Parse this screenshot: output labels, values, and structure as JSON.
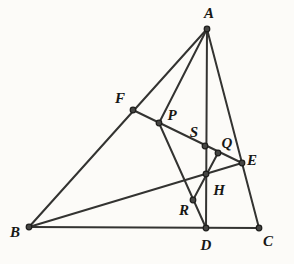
{
  "figure": {
    "canvas": {
      "width": 294,
      "height": 264,
      "background": "#fcfbf8"
    },
    "style": {
      "line_color": "#333331",
      "line_width": 2,
      "dot_fill": "#454543",
      "dot_stroke": "#1d1d1b",
      "dot_radius": 2.8,
      "label_color": "#171715",
      "label_font_size": 15
    },
    "points": {
      "A": {
        "label": "A",
        "x": 207,
        "y": 29,
        "label_x": 209,
        "label_y": 18,
        "anchor": "middle"
      },
      "B": {
        "label": "B",
        "x": 29,
        "y": 227,
        "label_x": 15,
        "label_y": 237,
        "anchor": "middle"
      },
      "C": {
        "label": "C",
        "x": 259,
        "y": 228,
        "label_x": 268,
        "label_y": 246,
        "anchor": "middle"
      },
      "D": {
        "label": "D",
        "x": 206,
        "y": 228,
        "label_x": 206,
        "label_y": 250,
        "anchor": "middle"
      },
      "E": {
        "label": "E",
        "x": 242,
        "y": 163,
        "label_x": 252,
        "label_y": 165,
        "anchor": "middle"
      },
      "F": {
        "label": "F",
        "x": 133,
        "y": 110,
        "label_x": 120,
        "label_y": 103,
        "anchor": "middle"
      },
      "P": {
        "label": "P",
        "x": 159,
        "y": 123,
        "label_x": 172,
        "label_y": 120,
        "anchor": "middle"
      },
      "S": {
        "label": "S",
        "x": 205,
        "y": 146,
        "label_x": 194,
        "label_y": 137,
        "anchor": "middle"
      },
      "Q": {
        "label": "Q",
        "x": 218,
        "y": 153,
        "label_x": 227,
        "label_y": 148,
        "anchor": "middle"
      },
      "H": {
        "label": "H",
        "x": 206,
        "y": 174,
        "label_x": 219,
        "label_y": 195,
        "anchor": "middle"
      },
      "R": {
        "label": "R",
        "x": 193,
        "y": 200,
        "label_x": 184,
        "label_y": 215,
        "anchor": "middle"
      }
    },
    "segments": [
      [
        "A",
        "B"
      ],
      [
        "B",
        "C"
      ],
      [
        "A",
        "C"
      ],
      [
        "A",
        "D"
      ],
      [
        "B",
        "E"
      ],
      [
        "F",
        "E"
      ],
      [
        "A",
        "P"
      ],
      [
        "P",
        "D"
      ],
      [
        "Q",
        "R"
      ]
    ]
  }
}
